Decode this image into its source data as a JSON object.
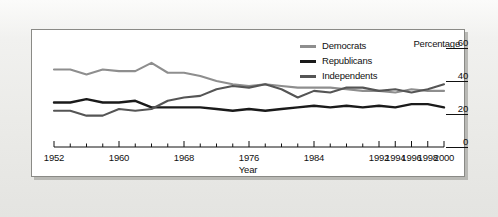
{
  "chart_data": {
    "type": "line",
    "title": "",
    "xlabel": "Year",
    "ylabel": "Percentage",
    "ylim": [
      0,
      60
    ],
    "yticks": [
      0,
      20,
      40,
      60
    ],
    "xlim": [
      1952,
      2000
    ],
    "xticks_labeled": [
      1952,
      1960,
      1968,
      1976,
      1984,
      1992,
      1994,
      1996,
      1998,
      2000
    ],
    "xtick_minor_step": 2,
    "grid": false,
    "legend_position": "top-right-inside",
    "x": [
      1952,
      1954,
      1956,
      1958,
      1960,
      1962,
      1964,
      1966,
      1968,
      1970,
      1972,
      1974,
      1976,
      1978,
      1980,
      1982,
      1984,
      1986,
      1988,
      1990,
      1992,
      1994,
      1996,
      1998,
      2000
    ],
    "series": [
      {
        "name": "Democrats",
        "color": "#8e8e8e",
        "values": [
          47,
          47,
          44,
          47,
          46,
          46,
          51,
          45,
          45,
          43,
          40,
          38,
          37,
          38,
          37,
          36,
          36,
          36,
          35,
          34,
          34,
          33,
          35,
          34,
          34
        ]
      },
      {
        "name": "Republicans",
        "color": "#1a1a1a",
        "values": [
          27,
          27,
          29,
          27,
          27,
          28,
          24,
          24,
          24,
          24,
          23,
          22,
          23,
          22,
          23,
          24,
          25,
          24,
          25,
          24,
          25,
          24,
          26,
          26,
          24
        ]
      },
      {
        "name": "Independents",
        "color": "#555555",
        "values": [
          22,
          22,
          19,
          19,
          23,
          22,
          23,
          28,
          30,
          31,
          35,
          37,
          36,
          38,
          35,
          30,
          34,
          33,
          36,
          36,
          34,
          35,
          33,
          35,
          38
        ]
      }
    ],
    "legend": [
      {
        "label": "Democrats",
        "swatch_color": "#8e8e8e"
      },
      {
        "label": "Republicans",
        "swatch_color": "#1a1a1a"
      },
      {
        "label": "Independents",
        "swatch_color": "#555555"
      }
    ]
  },
  "axes": {
    "y_title": "Percentage",
    "y_tick_labels": [
      "60",
      "40",
      "20",
      "0"
    ],
    "x_title": "Year",
    "x_tick_labels": [
      "1952",
      "1960",
      "1968",
      "1976",
      "1984",
      "1992",
      "1994",
      "1996",
      "1998",
      "2000"
    ]
  },
  "colors": {
    "democrats": "#8e8e8e",
    "republicans": "#1a1a1a",
    "independents": "#555555",
    "panel_background": "#ffffff",
    "page_background": "#ebebe8",
    "axis": "#111111"
  }
}
